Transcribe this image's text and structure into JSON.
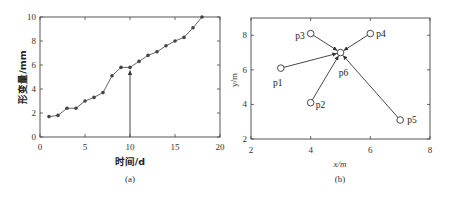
{
  "chart_data": [
    {
      "type": "line",
      "caption": "(a)",
      "title": "",
      "xlabel": "时间/d",
      "ylabel": "形变量/mm",
      "xlim": [
        0,
        20
      ],
      "ylim": [
        0,
        10
      ],
      "xticks": [
        0,
        5,
        10,
        15,
        20
      ],
      "yticks": [
        0,
        2,
        4,
        6,
        8,
        10
      ],
      "grid": false,
      "legend": null,
      "series": [
        {
          "name": "形变量",
          "x": [
            1,
            2,
            3,
            4,
            5,
            6,
            7,
            8,
            9,
            10,
            11,
            12,
            13,
            14,
            15,
            16,
            17,
            18
          ],
          "values": [
            1.7,
            1.8,
            2.4,
            2.4,
            3.0,
            3.3,
            3.7,
            5.1,
            5.8,
            5.8,
            6.3,
            6.8,
            7.1,
            7.6,
            8.0,
            8.3,
            9.1,
            10.0
          ]
        }
      ],
      "annotations": [
        {
          "type": "arrow",
          "from": [
            10,
            0
          ],
          "to": [
            10,
            5.8
          ],
          "note": "upward arrow at day 10"
        }
      ]
    },
    {
      "type": "scatter",
      "caption": "(b)",
      "title": "",
      "xlabel": "x/m",
      "ylabel": "y/m",
      "xlim": [
        2,
        8
      ],
      "ylim": [
        2,
        9
      ],
      "xticks": [
        2,
        4,
        6,
        8
      ],
      "yticks": [
        2,
        4,
        6,
        8
      ],
      "grid": false,
      "legend": null,
      "points": [
        {
          "label": "p1",
          "x": 3.0,
          "y": 6.1
        },
        {
          "label": "p2",
          "x": 4.0,
          "y": 4.1
        },
        {
          "label": "p3",
          "x": 4.0,
          "y": 8.1
        },
        {
          "label": "p4",
          "x": 6.0,
          "y": 8.1
        },
        {
          "label": "p5",
          "x": 7.0,
          "y": 3.1
        },
        {
          "label": "p6",
          "x": 5.0,
          "y": 7.0
        }
      ],
      "arrows": [
        {
          "from": "p1",
          "to": "p6"
        },
        {
          "from": "p2",
          "to": "p6"
        },
        {
          "from": "p3",
          "to": "p6"
        },
        {
          "from": "p4",
          "to": "p6"
        },
        {
          "from": "p5",
          "to": "p6"
        }
      ]
    }
  ]
}
